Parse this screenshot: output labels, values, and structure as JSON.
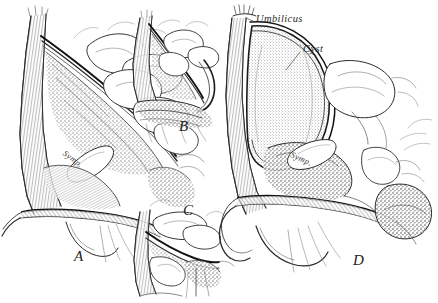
{
  "figure": {
    "type": "anatomical-illustration",
    "medium": "pen-and-ink line engraving",
    "background_color": "#ffffff",
    "ink_color": "#2b2b2b",
    "panel_count": 4,
    "caption": ""
  },
  "labels": {
    "umbilicus": "Umbilicus",
    "cyst": "Cyst",
    "symphysis_a": "Symp.",
    "symphysis_d": "Symp."
  },
  "panels": [
    {
      "letter": "A",
      "name": "panel-a",
      "position": "left",
      "note": "Large sagittal section, empty peritoneal sac with symphysis"
    },
    {
      "letter": "B",
      "name": "panel-b",
      "position": "top-center",
      "note": "Small sagittal section detail"
    },
    {
      "letter": "C",
      "name": "panel-c",
      "position": "bottom-center",
      "note": "Small sagittal section detail"
    },
    {
      "letter": "D",
      "name": "panel-d",
      "position": "right",
      "note": "Large sagittal section with distended cyst reaching umbilicus"
    }
  ]
}
